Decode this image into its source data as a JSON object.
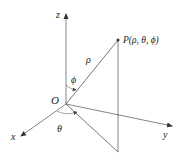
{
  "diagram": {
    "type": "spherical-coordinates",
    "labels": {
      "z_axis": "z",
      "x_axis": "x",
      "y_axis": "y",
      "origin": "O",
      "point": "P(ρ, θ, ϕ)",
      "rho": "ρ",
      "phi": "ϕ",
      "theta": "θ"
    },
    "colors": {
      "line": "#555555",
      "text": "#222222",
      "background": "#ffffff"
    }
  }
}
